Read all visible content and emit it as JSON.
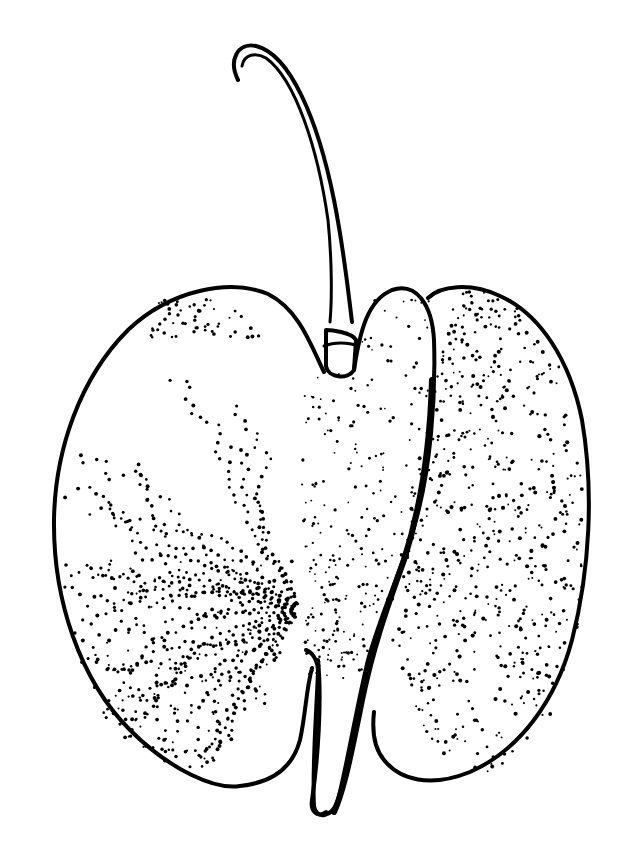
{
  "illustration": {
    "subject": "winged fruit (samara) with curved stalk",
    "style": "pen-and-ink stipple",
    "background_color": "#ffffff",
    "ink_color": "#000000",
    "width": 628,
    "height": 865
  },
  "parts": {
    "stalk": {
      "label": "curved stalk with hooked tip"
    },
    "left_wing": {
      "label": "left wing with radiating dotted veins"
    },
    "center_body": {
      "label": "central seed body"
    },
    "right_wing": {
      "label": "right wing densely stippled"
    },
    "basal_tail": {
      "label": "narrow basal extension"
    }
  },
  "stipple": {
    "left_wing_veins": 22,
    "right_wing_density": 1400,
    "center_density": 520,
    "seed": 7
  }
}
